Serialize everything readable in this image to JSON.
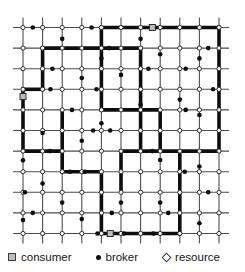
{
  "legend": {
    "items": [
      {
        "id": "consumer",
        "label": "consumer"
      },
      {
        "id": "broker",
        "label": "broker"
      },
      {
        "id": "resource",
        "label": "resource"
      }
    ]
  },
  "diagram": {
    "type": "mesh-network-figure",
    "grid": {
      "cols": 11,
      "rows": 11,
      "x0": 23,
      "y0": 27.5,
      "dx": 19.6,
      "dy": 20.6,
      "stub": 10
    },
    "colors": {
      "background": "#ffffff",
      "grid_line": "#4d4d4d",
      "path": "#0e0e0e",
      "node_stroke": "#2e2e2e",
      "resource_fill": "#ffffff",
      "broker_fill": "#0e0e0e",
      "consumer_fill": "#bdbdbd"
    },
    "sizes": {
      "grid_line_width": 1.1,
      "path_width": 3.6,
      "resource_r": 2.1,
      "broker_r": 2.3,
      "consumer_size": 6
    },
    "resources": "all-intersections",
    "path_edges": [
      {
        "type": "h",
        "row": 0,
        "c1": 4,
        "c2": 10
      },
      {
        "type": "h",
        "row": 1,
        "c1": 1,
        "c2": 6
      },
      {
        "type": "h",
        "row": 3,
        "c1": 0,
        "c2": 1
      },
      {
        "type": "h",
        "row": 4,
        "c1": 4,
        "c2": 7
      },
      {
        "type": "h",
        "row": 6,
        "c1": 0,
        "c2": 2
      },
      {
        "type": "h",
        "row": 6,
        "c1": 5,
        "c2": 10
      },
      {
        "type": "h",
        "row": 7,
        "c1": 2,
        "c2": 4
      },
      {
        "type": "h",
        "row": 10,
        "c1": 4,
        "c2": 8
      },
      {
        "type": "v",
        "col": 0,
        "r1": 3,
        "r2": 6
      },
      {
        "type": "v",
        "col": 1,
        "r1": 1,
        "r2": 3
      },
      {
        "type": "v",
        "col": 2,
        "r1": 4,
        "r2": 7
      },
      {
        "type": "v",
        "col": 4,
        "r1": 0,
        "r2": 4
      },
      {
        "type": "v",
        "col": 4,
        "r1": 7,
        "r2": 10
      },
      {
        "type": "v",
        "col": 5,
        "r1": 6,
        "r2": 8
      },
      {
        "type": "v",
        "col": 6,
        "r1": 1,
        "r2": 6
      },
      {
        "type": "v",
        "col": 7,
        "r1": 4,
        "r2": 6
      },
      {
        "type": "v",
        "col": 8,
        "r1": 6,
        "r2": 10
      },
      {
        "type": "v",
        "col": 10,
        "r1": 0,
        "r2": 6
      }
    ],
    "brokers": [
      {
        "on": "h",
        "row": 0,
        "ca": 0,
        "cb": 1,
        "t": 0.5
      },
      {
        "on": "h",
        "row": 0,
        "ca": 3,
        "cb": 4,
        "t": 0.5
      },
      {
        "on": "v",
        "col": 2,
        "ra": 0,
        "rb": 1,
        "t": 0.55
      },
      {
        "on": "v",
        "col": 6,
        "ra": 0,
        "rb": 1,
        "t": 0.55
      },
      {
        "on": "h",
        "row": 1,
        "ca": 4,
        "cb": 5,
        "t": 0.4
      },
      {
        "on": "h",
        "row": 1,
        "ca": 9,
        "cb": 10,
        "t": 0.45
      },
      {
        "on": "v",
        "col": 9,
        "ra": 1,
        "rb": 2,
        "t": 0.5
      },
      {
        "on": "v",
        "col": 7,
        "ra": 1,
        "rb": 2,
        "t": 0.3
      },
      {
        "on": "v",
        "col": 4,
        "ra": 1,
        "rb": 2,
        "t": 0.5
      },
      {
        "on": "h",
        "row": 2,
        "ca": 1,
        "cb": 2,
        "t": 0.5
      },
      {
        "on": "h",
        "row": 2,
        "ca": 6,
        "cb": 7,
        "t": 0.4
      },
      {
        "on": "h",
        "row": 2,
        "ca": 8,
        "cb": 9,
        "t": 0.3
      },
      {
        "on": "v",
        "col": 3,
        "ra": 2,
        "rb": 3,
        "t": 0.45
      },
      {
        "on": "v",
        "col": 5,
        "ra": 2,
        "rb": 3,
        "t": 0.3
      },
      {
        "on": "h",
        "row": 3,
        "ca": 1,
        "cb": 2,
        "t": 0.4
      },
      {
        "on": "h",
        "row": 3,
        "ca": 3,
        "cb": 4,
        "t": 0.75
      },
      {
        "on": "h",
        "row": 3,
        "ca": 9,
        "cb": 10,
        "t": 0.7
      },
      {
        "on": "v",
        "col": 6,
        "ra": 3,
        "rb": 4,
        "t": 0.75
      },
      {
        "on": "v",
        "col": 8,
        "ra": 3,
        "rb": 4,
        "t": 0.5
      },
      {
        "on": "h",
        "row": 4,
        "ca": 2,
        "cb": 3,
        "t": 0.5
      },
      {
        "on": "h",
        "row": 4,
        "ca": 8,
        "cb": 9,
        "t": 0.3
      },
      {
        "on": "v",
        "col": 4,
        "ra": 4,
        "rb": 5,
        "t": 0.65
      },
      {
        "on": "v",
        "col": 9,
        "ra": 4,
        "rb": 5,
        "t": 0.25
      },
      {
        "on": "h",
        "row": 5,
        "ca": 3,
        "cb": 4,
        "t": 0.58
      },
      {
        "on": "h",
        "row": 5,
        "ca": 4,
        "cb": 5,
        "t": 0.45
      },
      {
        "on": "v",
        "col": 1,
        "ra": 5,
        "rb": 6,
        "t": 0.12
      },
      {
        "on": "v",
        "col": 3,
        "ra": 5,
        "rb": 6,
        "t": 0.5
      },
      {
        "on": "h",
        "row": 6,
        "ca": 1,
        "cb": 2,
        "t": 0.38
      },
      {
        "on": "h",
        "row": 6,
        "ca": 6,
        "cb": 7,
        "t": 0.6
      },
      {
        "on": "v",
        "col": 0,
        "ra": 6,
        "rb": 7,
        "t": 0.45
      },
      {
        "on": "v",
        "col": 9,
        "ra": 6,
        "rb": 7,
        "t": 0.75
      },
      {
        "on": "v",
        "col": 7,
        "ra": 6,
        "rb": 7,
        "t": 0.43
      },
      {
        "on": "h",
        "row": 7,
        "ca": 2,
        "cb": 3,
        "t": 0.4
      },
      {
        "on": "h",
        "row": 7,
        "ca": 3,
        "cb": 4,
        "t": 0.15
      },
      {
        "on": "h",
        "row": 7,
        "ca": 8,
        "cb": 9,
        "t": 0.25
      },
      {
        "on": "v",
        "col": 1,
        "ra": 7,
        "rb": 8,
        "t": 0.57
      },
      {
        "on": "h",
        "row": 8,
        "ca": 0,
        "cb": 1,
        "t": 0.1
      },
      {
        "on": "h",
        "row": 8,
        "ca": 9,
        "cb": 10,
        "t": 0.45
      },
      {
        "on": "v",
        "col": 2,
        "ra": 8,
        "rb": 9,
        "t": 0.5
      },
      {
        "on": "v",
        "col": 5,
        "ra": 8,
        "rb": 9,
        "t": 0.5
      },
      {
        "on": "v",
        "col": 7,
        "ra": 8,
        "rb": 9,
        "t": 0.5
      },
      {
        "on": "h",
        "row": 9,
        "ca": 0,
        "cb": 1,
        "t": 0.5
      },
      {
        "on": "h",
        "row": 9,
        "ca": 4,
        "cb": 5,
        "t": 0.53
      },
      {
        "on": "h",
        "row": 9,
        "ca": 7,
        "cb": 8,
        "t": 0.41
      },
      {
        "on": "v",
        "col": 0,
        "ra": 9,
        "rb": 10,
        "t": 0.35
      },
      {
        "on": "v",
        "col": 3,
        "ra": 9,
        "rb": 10,
        "t": 0.3
      },
      {
        "on": "v",
        "col": 9,
        "ra": 9,
        "rb": 10,
        "t": 0.5
      },
      {
        "on": "h",
        "row": 10,
        "ca": 3,
        "cb": 4,
        "t": 0.8
      },
      {
        "on": "h",
        "row": 10,
        "ca": 5,
        "cb": 6,
        "t": 0.15
      },
      {
        "on": "h",
        "row": 10,
        "ca": 6,
        "cb": 7,
        "t": 0.65
      }
    ],
    "consumers": [
      {
        "on": "h",
        "row": 0,
        "ca": 6,
        "cb": 7,
        "t": 0.6
      },
      {
        "on": "v",
        "col": 0,
        "ra": 3,
        "rb": 4,
        "t": 0.35
      },
      {
        "on": "h",
        "row": 10,
        "ca": 4,
        "cb": 5,
        "t": 0.45
      }
    ]
  }
}
